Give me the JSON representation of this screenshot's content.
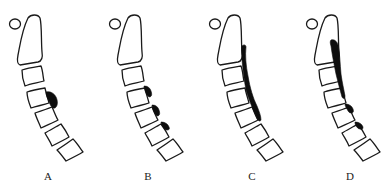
{
  "figure": {
    "colors": {
      "bone_outline": "#1a1a1a",
      "ossification": "#0d0d0d",
      "background": "#ffffff"
    },
    "panels": [
      {
        "id": "A",
        "label": "A",
        "offset_x": 0,
        "pattern": "single-segmental"
      },
      {
        "id": "B",
        "label": "B",
        "offset_x": 100,
        "pattern": "multiple-segmental"
      },
      {
        "id": "C",
        "label": "C",
        "offset_x": 200,
        "pattern": "continuous"
      },
      {
        "id": "D",
        "label": "D",
        "offset_x": 297,
        "pattern": "mixed"
      }
    ]
  }
}
